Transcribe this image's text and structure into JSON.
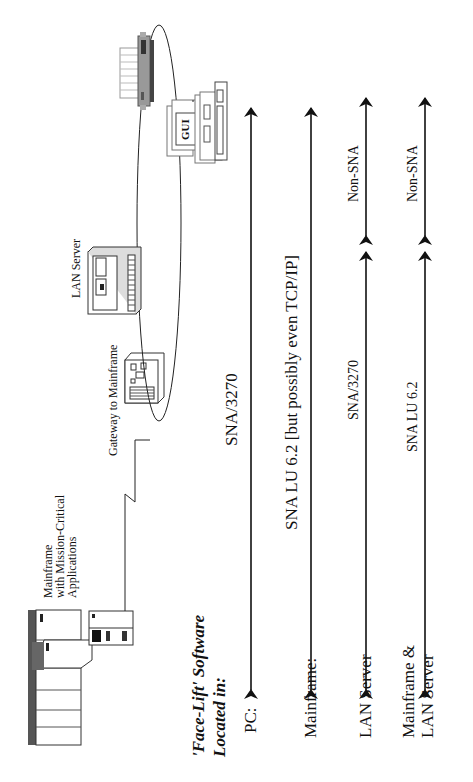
{
  "devices": {
    "mainframe": {
      "label_lines": [
        "Mainframe",
        "with Mission-Critical",
        "Applications"
      ]
    },
    "gateway": {
      "label": "Gateway to Mainframe"
    },
    "lan_server": {
      "label": "LAN Server"
    },
    "pc": {
      "screen_label": "GUI"
    }
  },
  "legend": {
    "title_line1": "'Face-Lift' Software",
    "title_line2": "Located in:"
  },
  "rows": [
    {
      "location": "PC:",
      "protocol_mid": "SNA/3270"
    },
    {
      "location": "Mainframe:",
      "protocol_mid": "SNA LU 6.2 [but possibly even  TCP/IP]"
    },
    {
      "location": "LAN Server",
      "protocol_left": "SNA/3270",
      "protocol_right": "Non-SNA"
    },
    {
      "location_line1": "Mainframe &",
      "location_line2": "LAN Server",
      "protocol_left": "SNA LU 6.2",
      "protocol_right": "Non-SNA"
    }
  ]
}
